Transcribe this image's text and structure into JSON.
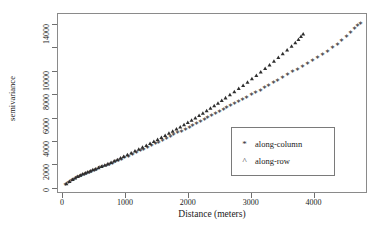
{
  "chart_data": {
    "type": "scatter",
    "title": "",
    "xlabel": "Distance (meters)",
    "ylabel": "semivariance",
    "xlim": [
      -80,
      4850
    ],
    "ylim": [
      -430,
      14900
    ],
    "grid": false,
    "legend_position": "inside-lower-right",
    "xticks": [
      0,
      1000,
      2000,
      3000,
      4000
    ],
    "xticklabels": [
      "0",
      "1000",
      "2000",
      "3000",
      "4000"
    ],
    "yticks": [
      0,
      2000,
      4000,
      6000,
      8000,
      10000,
      12000,
      14000
    ],
    "yticklabels": [
      "0",
      "2000",
      "4000",
      "6000",
      "8000",
      "10000",
      "",
      "14000"
    ],
    "series": [
      {
        "name": "along-column",
        "marker": "*",
        "color": "#262626",
        "points": [
          [
            60,
            330
          ],
          [
            110,
            520
          ],
          [
            150,
            690
          ],
          [
            190,
            820
          ],
          [
            230,
            950
          ],
          [
            270,
            1060
          ],
          [
            310,
            1150
          ],
          [
            350,
            1240
          ],
          [
            390,
            1330
          ],
          [
            430,
            1410
          ],
          [
            470,
            1500
          ],
          [
            510,
            1580
          ],
          [
            550,
            1660
          ],
          [
            600,
            1760
          ],
          [
            650,
            1860
          ],
          [
            700,
            1960
          ],
          [
            750,
            2070
          ],
          [
            800,
            2180
          ],
          [
            850,
            2290
          ],
          [
            900,
            2400
          ],
          [
            950,
            2520
          ],
          [
            1000,
            2640
          ],
          [
            1060,
            2780
          ],
          [
            1120,
            2920
          ],
          [
            1180,
            3060
          ],
          [
            1240,
            3210
          ],
          [
            1300,
            3360
          ],
          [
            1360,
            3510
          ],
          [
            1420,
            3660
          ],
          [
            1480,
            3810
          ],
          [
            1540,
            3960
          ],
          [
            1600,
            4110
          ],
          [
            1660,
            4270
          ],
          [
            1720,
            4420
          ],
          [
            1780,
            4580
          ],
          [
            1840,
            4740
          ],
          [
            1900,
            4900
          ],
          [
            1960,
            5060
          ],
          [
            2020,
            5220
          ],
          [
            2080,
            5380
          ],
          [
            2140,
            5550
          ],
          [
            2200,
            5710
          ],
          [
            2260,
            5880
          ],
          [
            2320,
            6040
          ],
          [
            2380,
            6210
          ],
          [
            2440,
            6370
          ],
          [
            2500,
            6540
          ],
          [
            2560,
            6710
          ],
          [
            2620,
            6880
          ],
          [
            2680,
            7050
          ],
          [
            2740,
            7220
          ],
          [
            2800,
            7390
          ],
          [
            2870,
            7590
          ],
          [
            2940,
            7790
          ],
          [
            3010,
            7990
          ],
          [
            3080,
            8190
          ],
          [
            3150,
            8390
          ],
          [
            3220,
            8600
          ],
          [
            3290,
            8810
          ],
          [
            3360,
            9020
          ],
          [
            3430,
            9230
          ],
          [
            3500,
            9450
          ],
          [
            3580,
            9690
          ],
          [
            3660,
            9940
          ],
          [
            3740,
            10180
          ],
          [
            3820,
            10430
          ],
          [
            3900,
            10680
          ],
          [
            3980,
            10930
          ],
          [
            4060,
            11190
          ],
          [
            4140,
            11450
          ],
          [
            4220,
            11720
          ],
          [
            4300,
            12000
          ],
          [
            4380,
            12300
          ],
          [
            4450,
            12600
          ],
          [
            4520,
            12950
          ],
          [
            4590,
            13320
          ],
          [
            4650,
            13650
          ],
          [
            4700,
            13900
          ],
          [
            4740,
            14050
          ]
        ]
      },
      {
        "name": "along-row",
        "marker": "^",
        "color": "#2e2e2e",
        "points": [
          [
            70,
            360
          ],
          [
            120,
            560
          ],
          [
            170,
            730
          ],
          [
            210,
            860
          ],
          [
            250,
            980
          ],
          [
            290,
            1090
          ],
          [
            330,
            1190
          ],
          [
            370,
            1280
          ],
          [
            410,
            1370
          ],
          [
            450,
            1460
          ],
          [
            490,
            1550
          ],
          [
            530,
            1630
          ],
          [
            580,
            1730
          ],
          [
            630,
            1840
          ],
          [
            680,
            1950
          ],
          [
            730,
            2060
          ],
          [
            780,
            2180
          ],
          [
            830,
            2300
          ],
          [
            880,
            2420
          ],
          [
            930,
            2550
          ],
          [
            980,
            2680
          ],
          [
            1040,
            2830
          ],
          [
            1100,
            2990
          ],
          [
            1160,
            3150
          ],
          [
            1220,
            3310
          ],
          [
            1280,
            3470
          ],
          [
            1340,
            3630
          ],
          [
            1400,
            3800
          ],
          [
            1460,
            3970
          ],
          [
            1520,
            4140
          ],
          [
            1580,
            4310
          ],
          [
            1640,
            4480
          ],
          [
            1700,
            4660
          ],
          [
            1760,
            4840
          ],
          [
            1820,
            5020
          ],
          [
            1880,
            5200
          ],
          [
            1940,
            5390
          ],
          [
            2000,
            5580
          ],
          [
            2060,
            5770
          ],
          [
            2120,
            5970
          ],
          [
            2180,
            6170
          ],
          [
            2240,
            6380
          ],
          [
            2300,
            6590
          ],
          [
            2360,
            6800
          ],
          [
            2420,
            7010
          ],
          [
            2480,
            7230
          ],
          [
            2540,
            7450
          ],
          [
            2600,
            7680
          ],
          [
            2670,
            7940
          ],
          [
            2740,
            8200
          ],
          [
            2810,
            8470
          ],
          [
            2880,
            8740
          ],
          [
            2950,
            9020
          ],
          [
            3020,
            9300
          ],
          [
            3090,
            9590
          ],
          [
            3160,
            9880
          ],
          [
            3230,
            10180
          ],
          [
            3300,
            10490
          ],
          [
            3370,
            10800
          ],
          [
            3440,
            11110
          ],
          [
            3510,
            11430
          ],
          [
            3580,
            11760
          ],
          [
            3650,
            12080
          ],
          [
            3710,
            12380
          ],
          [
            3760,
            12660
          ],
          [
            3800,
            12900
          ],
          [
            3835,
            13120
          ]
        ]
      }
    ]
  },
  "legend": {
    "items": [
      {
        "marker": "*",
        "label": "along-column"
      },
      {
        "marker": "^",
        "label": "along-row"
      }
    ]
  }
}
